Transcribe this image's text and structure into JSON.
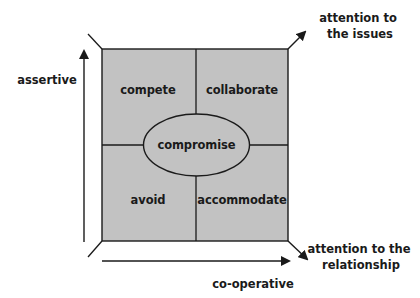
{
  "diagram": {
    "type": "conflict-modes-grid",
    "colors": {
      "quadrant_fill": "#c2c2c2",
      "line": "#1a1a1a",
      "text": "#1a1a1a",
      "background": "#ffffff"
    },
    "quadrants": {
      "top_left": "compete",
      "top_right": "collaborate",
      "bottom_left": "avoid",
      "bottom_right": "accommodate"
    },
    "center": "compromise",
    "axes": {
      "vertical": "assertive",
      "horizontal": "co-operative"
    },
    "corner_labels": {
      "top_right": [
        "attention to",
        "the issues"
      ],
      "bottom_right": [
        "attention to the",
        "relationship"
      ]
    }
  }
}
